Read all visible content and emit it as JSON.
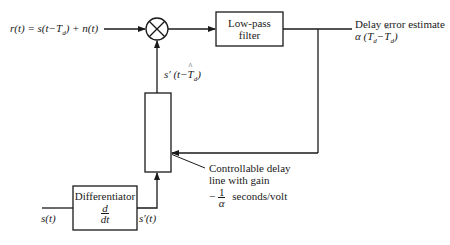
{
  "diagram": {
    "type": "block-diagram",
    "input_signal": {
      "label": "r(t) = s(t−T_d) + n(t)",
      "parts": {
        "lhs": "r(t) = s(t−T",
        "sub": "d",
        "rhs": ") + n(t)"
      }
    },
    "multiplier": {
      "symbol": "⊗",
      "name": "multiplier"
    },
    "lowpass_filter": {
      "line1": "Low-pass",
      "line2": "filter"
    },
    "output": {
      "line1": "Delay error estimate",
      "expr_prefix": "α (T",
      "expr_sub1": "d",
      "expr_mid": "−",
      "expr_hat_T": "T",
      "expr_sub2": "d",
      "expr_suffix": ")"
    },
    "delayed_derivative": {
      "prefix": "s′ (t−",
      "hat_T": "T",
      "sub": "d",
      "suffix": ")"
    },
    "delay_line": {
      "line1": "Controllable delay",
      "line2": "line with gain",
      "gain_sign": "−",
      "gain_num": "1",
      "gain_den": "α",
      "gain_units": "seconds/volt"
    },
    "differentiator": {
      "label": "Differentiator",
      "num": "d",
      "den": "dt"
    },
    "source_signal": {
      "label": "s(t)"
    },
    "derivative_signal": {
      "label": "s′(t)"
    },
    "colors": {
      "line": "#1a1a1a",
      "background": "#ffffff"
    }
  }
}
